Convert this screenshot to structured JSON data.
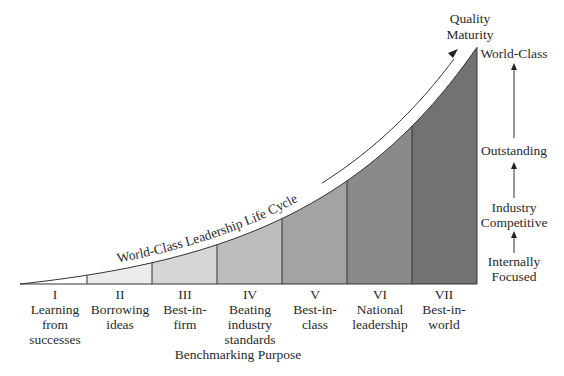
{
  "diagram": {
    "title_axis_x": "Benchmarking Purpose",
    "title_axis_y": [
      "Quality",
      "Maturity"
    ],
    "curve_label": "World-Class Leadership Life Cycle",
    "stages": [
      {
        "numeral": "I",
        "lines": [
          "Learning",
          "from",
          "successes"
        ],
        "fill": "#ffffff"
      },
      {
        "numeral": "II",
        "lines": [
          "Borrowing",
          "ideas"
        ],
        "fill": "#ececec"
      },
      {
        "numeral": "III",
        "lines": [
          "Best-in-",
          "firm"
        ],
        "fill": "#d6d6d6"
      },
      {
        "numeral": "IV",
        "lines": [
          "Beating",
          "industry",
          "standards"
        ],
        "fill": "#bdbdbd"
      },
      {
        "numeral": "V",
        "lines": [
          "Best-in-",
          "class"
        ],
        "fill": "#a3a3a3"
      },
      {
        "numeral": "VI",
        "lines": [
          "National",
          "leadership"
        ],
        "fill": "#8a8a8a"
      },
      {
        "numeral": "VII",
        "lines": [
          "Best-in-",
          "world"
        ],
        "fill": "#727272"
      }
    ],
    "maturity_levels": [
      {
        "lines": [
          "Internally",
          "Focused"
        ]
      },
      {
        "lines": [
          "Industry",
          "Competitive"
        ]
      },
      {
        "lines": [
          "Outstanding"
        ]
      },
      {
        "lines": [
          "World-Class"
        ]
      }
    ]
  },
  "chart_data": {
    "type": "area",
    "title": "World-Class Leadership Life Cycle",
    "xlabel": "Benchmarking Purpose",
    "ylabel": "Quality Maturity",
    "categories": [
      "I Learning from successes",
      "II Borrowing ideas",
      "III Best-in-firm",
      "IV Beating industry standards",
      "V Best-in-class",
      "VI National leadership",
      "VII Best-in-world"
    ],
    "y_levels": [
      "Internally Focused",
      "Industry Competitive",
      "Outstanding",
      "World-Class"
    ],
    "curve": "exponential rise from baseline at stage I to World-Class at end of stage VII"
  }
}
